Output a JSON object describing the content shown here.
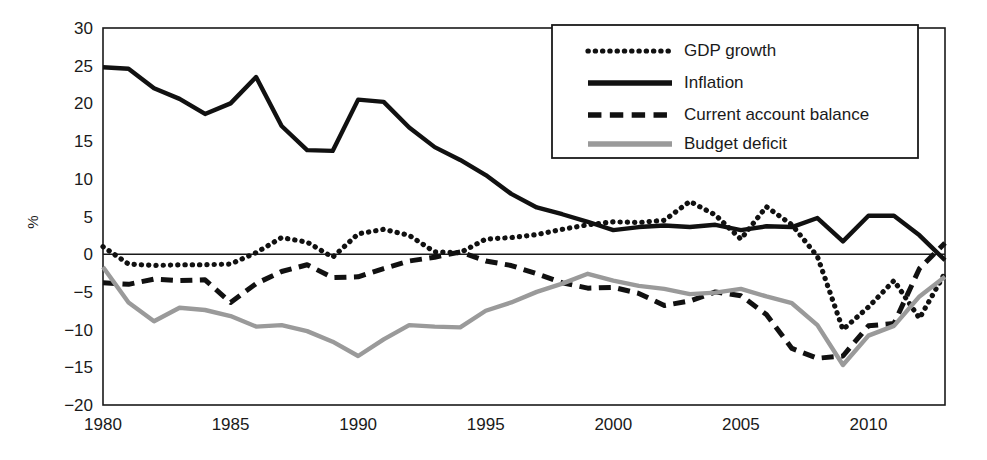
{
  "chart_data": {
    "type": "line",
    "title": "",
    "xlabel": "",
    "ylabel": "%",
    "xlim": [
      1980,
      2013
    ],
    "ylim": [
      -20,
      30
    ],
    "ytick_labels": [
      "30",
      "25",
      "20",
      "15",
      "10",
      "5",
      "0",
      "-5",
      "-10",
      "-15",
      "-20"
    ],
    "yticks": [
      30,
      25,
      20,
      15,
      10,
      5,
      0,
      -5,
      -10,
      -15,
      -20
    ],
    "xtick_labels": [
      "1980",
      "1985",
      "1990",
      "1995",
      "2000",
      "2005",
      "2010"
    ],
    "xticks": [
      1980,
      1985,
      1990,
      1995,
      2000,
      2005,
      2010
    ],
    "grid": false,
    "zero_line": true,
    "legend_position": "top-right",
    "x": [
      1980,
      1981,
      1982,
      1983,
      1984,
      1985,
      1986,
      1987,
      1988,
      1989,
      1990,
      1991,
      1992,
      1993,
      1994,
      1995,
      1996,
      1997,
      1998,
      1999,
      2000,
      2001,
      2002,
      2003,
      2004,
      2005,
      2006,
      2007,
      2008,
      2009,
      2010,
      2011,
      2012,
      2013
    ],
    "series": [
      {
        "name": "GDP growth",
        "style": "dotted",
        "color": "#111111",
        "values": [
          1.0,
          -1.3,
          -1.5,
          -1.4,
          -1.4,
          -1.3,
          0.2,
          2.2,
          1.6,
          -0.4,
          2.7,
          3.3,
          2.5,
          0.3,
          0.2,
          2.0,
          2.2,
          2.6,
          3.3,
          3.9,
          4.3,
          4.2,
          4.5,
          7.0,
          5.2,
          2.0,
          6.3,
          3.9,
          -0.3,
          -10.0,
          -7.0,
          -3.5,
          -8.5,
          -2.5
        ]
      },
      {
        "name": "Inflation",
        "style": "solid",
        "color": "#111111",
        "values": [
          24.8,
          24.6,
          22.0,
          20.6,
          18.6,
          20.0,
          23.5,
          17.0,
          13.8,
          13.7,
          20.5,
          20.2,
          16.8,
          14.2,
          12.5,
          10.5,
          8.0,
          6.2,
          5.3,
          4.3,
          3.2,
          3.6,
          3.8,
          3.6,
          3.9,
          3.2,
          3.7,
          3.6,
          4.8,
          1.7,
          5.1,
          5.1,
          2.5,
          -0.8
        ]
      },
      {
        "name": "Current account balance",
        "style": "dashed",
        "color": "#111111",
        "values": [
          -3.8,
          -4.0,
          -3.3,
          -3.5,
          -3.4,
          -6.4,
          -3.9,
          -2.3,
          -1.4,
          -3.1,
          -3.0,
          -1.9,
          -0.9,
          -0.4,
          0.3,
          -0.9,
          -1.5,
          -2.6,
          -3.8,
          -4.5,
          -4.4,
          -5.2,
          -6.8,
          -6.2,
          -5.0,
          -5.5,
          -8.0,
          -12.5,
          -13.8,
          -13.5,
          -9.5,
          -9.2,
          -1.9,
          1.5
        ]
      },
      {
        "name": "Budget deficit",
        "style": "solid",
        "color": "#9a9a9a",
        "values": [
          -1.7,
          -6.4,
          -8.9,
          -7.1,
          -7.4,
          -8.2,
          -9.6,
          -9.4,
          -10.2,
          -11.6,
          -13.5,
          -11.3,
          -9.4,
          -9.6,
          -9.7,
          -7.5,
          -6.4,
          -5.0,
          -3.9,
          -2.6,
          -3.5,
          -4.2,
          -4.6,
          -5.3,
          -5.1,
          -4.6,
          -5.6,
          -6.5,
          -9.4,
          -14.7,
          -10.8,
          -9.5,
          -5.6,
          -3.0
        ]
      }
    ]
  },
  "legend": {
    "items": [
      {
        "label": "GDP growth"
      },
      {
        "label": "Inflation"
      },
      {
        "label": "Current account balance"
      },
      {
        "label": "Budget deficit"
      }
    ]
  },
  "axis": {
    "y_title": "%"
  }
}
